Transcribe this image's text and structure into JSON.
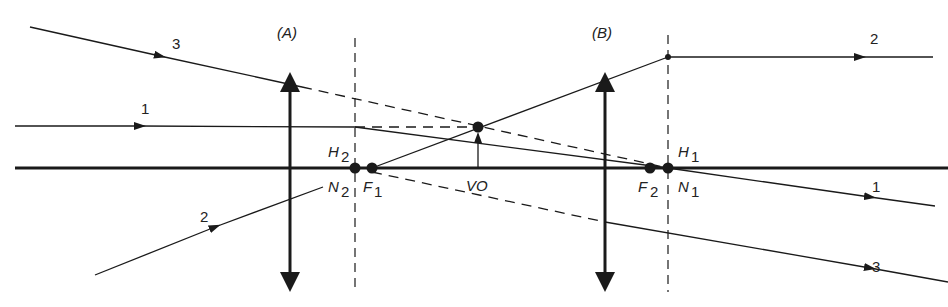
{
  "diagram": {
    "type": "thick-lens optics ray diagram",
    "colors": {
      "ink": "#1a1a1a",
      "background": "#ffffff"
    },
    "lenses": [
      {
        "id": "A",
        "label": "(A)",
        "x": 290
      },
      {
        "id": "B",
        "label": "(B)",
        "x": 605
      }
    ],
    "principal_planes": [
      {
        "id": "H2",
        "x": 355
      },
      {
        "id": "H1",
        "x": 668
      }
    ],
    "points": {
      "H2": {
        "label": "H",
        "sub": "2"
      },
      "N2": {
        "label": "N",
        "sub": "2"
      },
      "F1": {
        "label": "F",
        "sub": "1"
      },
      "VO": {
        "label": "VO"
      },
      "F2": {
        "label": "F",
        "sub": "2"
      },
      "H1": {
        "label": "H",
        "sub": "1"
      },
      "N1": {
        "label": "N",
        "sub": "1"
      }
    },
    "rays": [
      {
        "id": "1",
        "label_in": "1",
        "label_out": "1"
      },
      {
        "id": "2",
        "label_in": "2",
        "label_out": "2"
      },
      {
        "id": "3",
        "label_in": "3",
        "label_out": "3"
      }
    ]
  }
}
